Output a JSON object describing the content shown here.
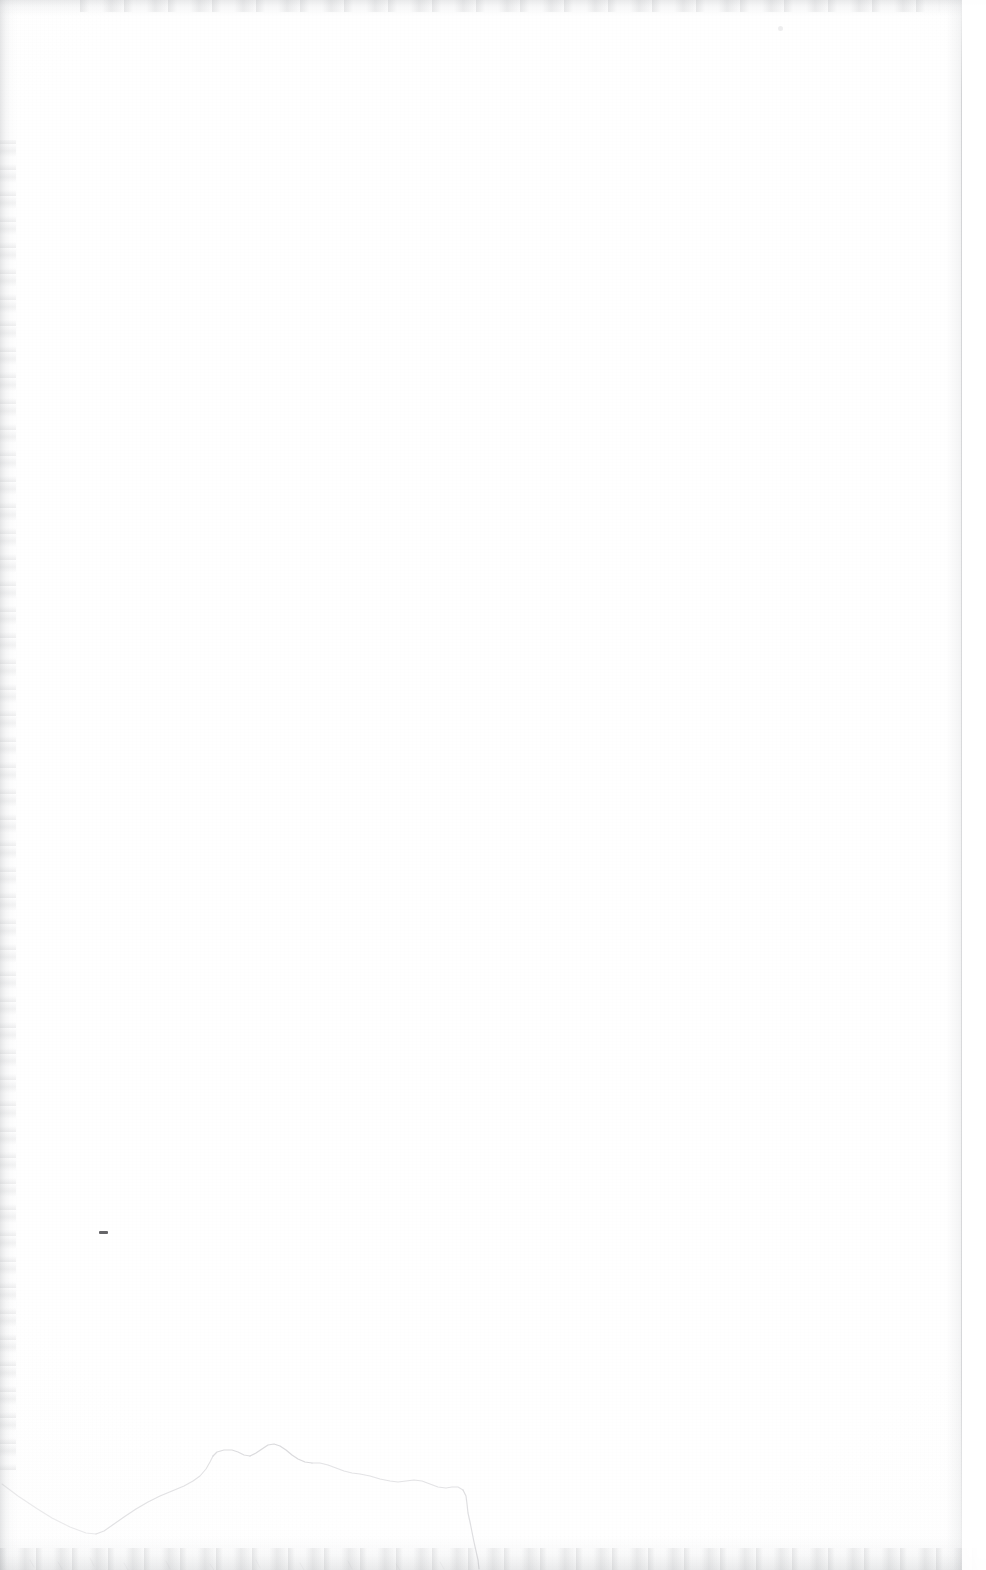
{
  "page": {
    "kind": "scanned-blank-page",
    "width": 986,
    "height": 1570,
    "paper_color": "#fefefe",
    "ink_color": "#3a3a3e",
    "edge_shadow_color": "#aaacb0",
    "visible_text": "",
    "caption": ""
  },
  "artifacts": {
    "left_edge_band_label": "",
    "top_edge_band_label": "",
    "bottom_edge_band_label": "",
    "right_page_edge_label": "",
    "speck_dash_label": "",
    "speck_faint_label": ""
  },
  "ridge": {
    "label": "",
    "stroke_color": "#8a8a92",
    "outline_points": "2,1484 18,1496 36,1508 52,1518 70,1527 86,1533 96,1534 104,1531 114,1524 124,1517 136,1509 148,1502 160,1496 172,1491 184,1486 193,1481 200,1476 206,1469 210,1462 213,1456 217,1452 224,1450 232,1450 238,1452 244,1455 250,1456 256,1453 262,1449 268,1445 274,1444 280,1446 286,1450 292,1455 298,1459 305,1462 312,1463 320,1463 328,1465 336,1468 344,1471 352,1473 360,1474 370,1476 380,1479 390,1481 398,1482 406,1481 414,1480 422,1481 430,1484 438,1487 446,1488 452,1487 458,1487 463,1490 466,1496 467,1504 468,1513 470,1522 472,1532 474,1542 476,1551 478,1560 479,1568"
  }
}
